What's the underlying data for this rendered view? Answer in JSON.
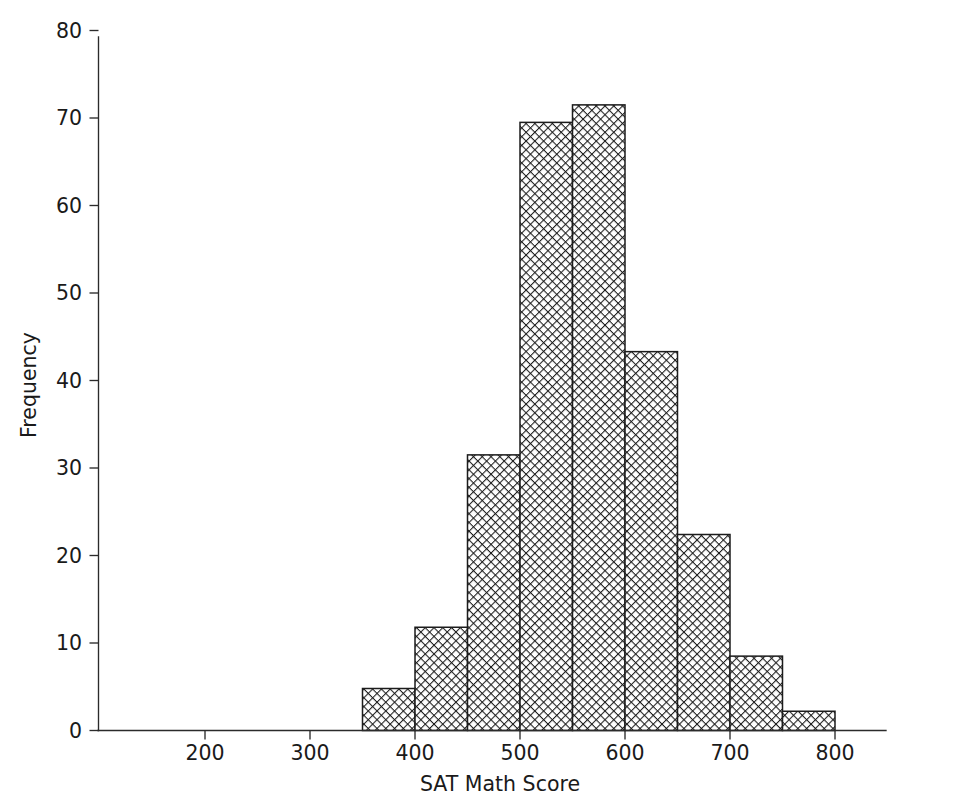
{
  "chart_data": {
    "type": "bar",
    "title": "",
    "subtitle": "",
    "xlabel": "SAT Math Score",
    "ylabel": "Frequency",
    "xlim": [
      120,
      870
    ],
    "ylim": [
      0,
      80
    ],
    "grid": false,
    "legend": false,
    "bin_width": 50,
    "bin_edges": [
      350,
      400,
      450,
      500,
      550,
      600,
      650,
      700,
      750,
      800
    ],
    "categories": [
      "350-400",
      "400-450",
      "450-500",
      "500-550",
      "550-600",
      "600-650",
      "650-700",
      "700-750",
      "750-800"
    ],
    "values": [
      4.8,
      11.8,
      31.5,
      69.5,
      71.5,
      43.3,
      22.4,
      8.5,
      2.2
    ],
    "x_ticks": [
      200,
      300,
      400,
      500,
      600,
      700,
      800
    ],
    "x_tick_labels": [
      "200",
      "300",
      "400",
      "500",
      "600",
      "700",
      "800"
    ],
    "y_ticks": [
      0,
      10,
      20,
      30,
      40,
      50,
      60,
      70,
      80
    ],
    "y_tick_labels": [
      "0",
      "10",
      "20",
      "30",
      "40",
      "50",
      "60",
      "70",
      "80"
    ],
    "bar_fill_pattern": "crosshatch",
    "bar_edge_color": "#1c1c1c",
    "bar_pattern_color": "#1c1c1c",
    "axis_color": "#2b2b2b",
    "background_color": "#ffffff"
  },
  "axes": {
    "x_axis_label": "SAT Math Score",
    "y_axis_label": "Frequency"
  }
}
